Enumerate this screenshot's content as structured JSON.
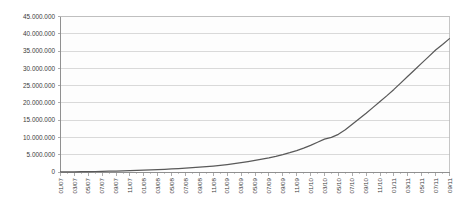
{
  "chart_data": {
    "type": "line",
    "title": "",
    "subtitle": "",
    "xlabel": "",
    "ylabel": "",
    "ylim": [
      0,
      45000000
    ],
    "ytick_step": 5000000,
    "ytick_labels": [
      "45.000.000",
      "40.000.000",
      "35.000.000",
      "30.000.000",
      "25.000.000",
      "20.000.000",
      "15.000.000",
      "10.000.000",
      "5.000.000",
      "0"
    ],
    "ytick_values": [
      45000000,
      40000000,
      35000000,
      30000000,
      25000000,
      20000000,
      15000000,
      10000000,
      5000000,
      0
    ],
    "grid": true,
    "grid_axis": "y",
    "legend": false,
    "legend_position": "none",
    "number_format": "european-dot-thousands",
    "xtick_labels": [
      "01/07",
      "03/07",
      "05/07",
      "07/07",
      "09/07",
      "11/07",
      "01/08",
      "03/08",
      "05/08",
      "07/08",
      "09/08",
      "11/08",
      "01/09",
      "03/09",
      "05/09",
      "07/09",
      "09/09",
      "11/09",
      "01/10",
      "03/10",
      "05/10",
      "07/10",
      "09/10",
      "11/10",
      "01/11",
      "03/11",
      "05/11",
      "07/11",
      "09/11"
    ],
    "xtick_rotation_deg": -90,
    "x": [
      "01/07",
      "02/07",
      "03/07",
      "04/07",
      "05/07",
      "06/07",
      "07/07",
      "08/07",
      "09/07",
      "10/07",
      "11/07",
      "12/07",
      "01/08",
      "02/08",
      "03/08",
      "04/08",
      "05/08",
      "06/08",
      "07/08",
      "08/08",
      "09/08",
      "10/08",
      "11/08",
      "12/08",
      "01/09",
      "02/09",
      "03/09",
      "04/09",
      "05/09",
      "06/09",
      "07/09",
      "08/09",
      "09/09",
      "10/09",
      "11/09",
      "12/09",
      "01/10",
      "02/10",
      "03/10",
      "04/10",
      "05/10",
      "06/10",
      "07/10",
      "08/10",
      "09/10",
      "10/10",
      "11/10",
      "12/10",
      "01/11",
      "02/11",
      "03/11",
      "04/11",
      "05/11",
      "06/11",
      "07/11",
      "08/11",
      "09/11"
    ],
    "series": [
      {
        "name": "cumulative-total",
        "color": "#595959",
        "values": [
          20000,
          35000,
          55000,
          80000,
          110000,
          145000,
          185000,
          230000,
          280000,
          335000,
          395000,
          460000,
          530000,
          605000,
          690000,
          780000,
          880000,
          990000,
          1110000,
          1240000,
          1390000,
          1550000,
          1730000,
          1930000,
          2150000,
          2400000,
          2680000,
          2990000,
          3340000,
          3700000,
          4100000,
          4550000,
          5050000,
          5600000,
          6200000,
          6900000,
          7700000,
          8600000,
          9500000,
          10000000,
          10900000,
          12200000,
          13800000,
          15400000,
          17000000,
          18700000,
          20400000,
          22100000,
          23900000,
          25800000,
          27700000,
          29600000,
          31500000,
          33400000,
          35300000,
          36900000,
          38600000
        ]
      }
    ],
    "annotations": []
  }
}
